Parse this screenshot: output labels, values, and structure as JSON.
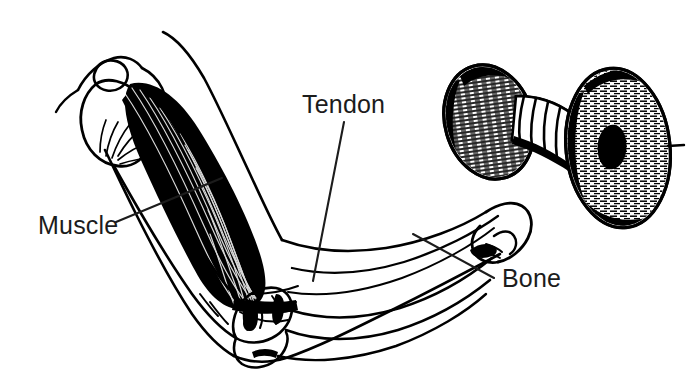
{
  "figure": {
    "style": "black and white pen-and-ink line drawing",
    "background_color": "#ffffff",
    "ink_color": "#000000",
    "text_color": "#1c1c1c",
    "width": 692,
    "height": 381
  },
  "labels": [
    {
      "id": "muscle",
      "text": "Muscle",
      "text_x": 38,
      "text_y": 234,
      "leader": {
        "from_x": 116,
        "from_y": 222,
        "to_x": 222,
        "to_y": 178
      }
    },
    {
      "id": "tendon",
      "text": "Tendon",
      "text_x": 302,
      "text_y": 113,
      "leader": {
        "from_x": 344,
        "from_y": 122,
        "to_x": 313,
        "to_y": 281
      }
    },
    {
      "id": "bone",
      "text": "Bone",
      "text_x": 502,
      "text_y": 287,
      "leader": {
        "from_x": 494,
        "from_y": 278,
        "to_x": 413,
        "to_y": 234
      }
    }
  ],
  "parts": {
    "shoulder": "scapula and humeral head outline at upper left",
    "muscle": "biceps brachii rendered as solid black fibrous belly",
    "tendon": "tendon fanning into the elbow joint",
    "bones": "humerus, radius and ulna outlines",
    "forearm": "forearm skin outline sweeping to the right",
    "hand": "hand gripping the dumbbell bar",
    "dumbbell": "two hatched weight discs joined by a ribbed bar"
  }
}
